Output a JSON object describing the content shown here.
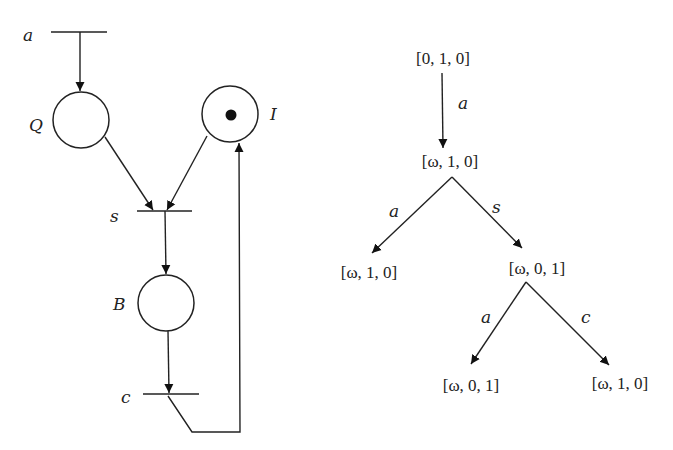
{
  "petri_net": {
    "places": [
      {
        "id": "Q",
        "label": "Q",
        "tokens": 0
      },
      {
        "id": "I",
        "label": "I",
        "tokens": 1
      },
      {
        "id": "B",
        "label": "B",
        "tokens": 0
      }
    ],
    "transitions": [
      {
        "id": "a",
        "label": "a"
      },
      {
        "id": "s",
        "label": "s"
      },
      {
        "id": "c",
        "label": "c"
      }
    ],
    "arcs": [
      {
        "from": "a",
        "to": "Q"
      },
      {
        "from": "Q",
        "to": "s"
      },
      {
        "from": "I",
        "to": "s"
      },
      {
        "from": "s",
        "to": "B"
      },
      {
        "from": "B",
        "to": "c"
      },
      {
        "from": "c",
        "to": "I"
      }
    ]
  },
  "coverability_tree": {
    "nodes": [
      {
        "id": "n0",
        "marking": "[0, 1, 0]"
      },
      {
        "id": "n1",
        "marking": "[ω, 1, 0]"
      },
      {
        "id": "n2",
        "marking": "[ω, 1, 0]"
      },
      {
        "id": "n3",
        "marking": "[ω, 0, 1]"
      },
      {
        "id": "n4",
        "marking": "[ω, 0, 1]"
      },
      {
        "id": "n5",
        "marking": "[ω, 1, 0]"
      }
    ],
    "edges": [
      {
        "from": "n0",
        "to": "n1",
        "label": "a"
      },
      {
        "from": "n1",
        "to": "n2",
        "label": "a"
      },
      {
        "from": "n1",
        "to": "n3",
        "label": "s"
      },
      {
        "from": "n3",
        "to": "n4",
        "label": "a"
      },
      {
        "from": "n3",
        "to": "n5",
        "label": "c"
      }
    ]
  }
}
